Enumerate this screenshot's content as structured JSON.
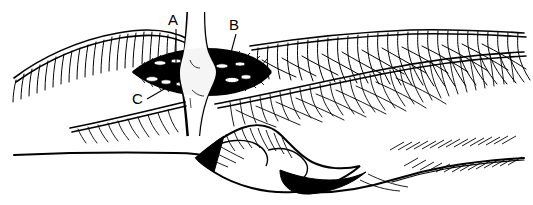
{
  "figure": {
    "medium": "pen-and-ink line drawing",
    "background_color": "#ffffff",
    "ink_color": "#000000",
    "width": 533,
    "height": 205,
    "labels": [
      {
        "id": "label-a",
        "text": "A",
        "x": 174,
        "y": 25,
        "leader": {
          "x1": 176,
          "y1": 29,
          "x2": 176,
          "y2": 66
        }
      },
      {
        "id": "label-b",
        "text": "B",
        "x": 234,
        "y": 30,
        "leader": {
          "x1": 236,
          "y1": 34,
          "x2": 229,
          "y2": 60
        }
      },
      {
        "id": "label-c",
        "text": "C",
        "x": 136,
        "y": 104,
        "leader": {
          "x1": 147,
          "y1": 99,
          "x2": 166,
          "y2": 88
        }
      }
    ],
    "regions": [
      {
        "id": "upper-limb-contour",
        "name": "upper limb contour with hatch shading"
      },
      {
        "id": "incision-opening",
        "name": "open surgical incision, dark interior"
      },
      {
        "id": "central-structure",
        "name": "pale vertical tendon-like structure"
      },
      {
        "id": "lower-limb-contour",
        "name": "lower limb contour with hatch shading"
      },
      {
        "id": "joint-region",
        "name": "shaded joint region"
      },
      {
        "id": "baseline-contour",
        "name": "long horizontal baseline contour"
      }
    ]
  }
}
